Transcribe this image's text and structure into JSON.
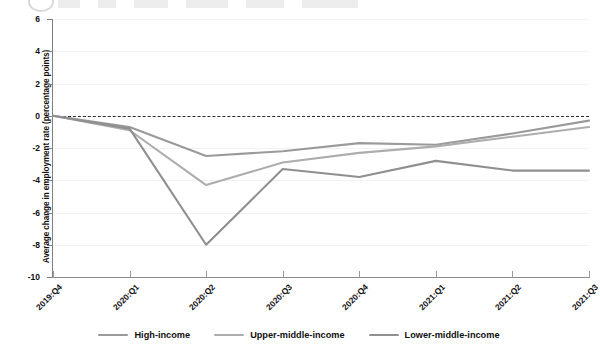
{
  "figure": {
    "logo_fragment": "circle-logo-icon"
  },
  "chart_data": {
    "type": "line",
    "title": "",
    "xlabel": "",
    "ylabel": "Average change in employment rate (percentage points)",
    "ylim": [
      -10,
      6
    ],
    "yticks": [
      6,
      4,
      2,
      0,
      -2,
      -4,
      -6,
      -8,
      -10
    ],
    "ytick_labels": [
      "6",
      "4",
      "2",
      "0",
      "-2",
      "-4",
      "-6",
      "-8",
      "-10"
    ],
    "grid": true,
    "legend_position": "bottom",
    "reference_line": {
      "value": 0,
      "style": "dashed",
      "color": "#2b2b2b"
    },
    "categories": [
      "2019:Q4",
      "2020:Q1",
      "2020:Q2",
      "2020:Q3",
      "2020:Q4",
      "2021:Q1",
      "2021:Q2",
      "2021:Q3"
    ],
    "series": [
      {
        "name": "High-income",
        "color": "#9a9a9a",
        "values": [
          0.0,
          -0.7,
          -2.5,
          -2.2,
          -1.7,
          -1.8,
          -1.1,
          -0.3
        ]
      },
      {
        "name": "Upper-middle-income",
        "color": "#adadad",
        "values": [
          0.0,
          -0.9,
          -4.3,
          -2.9,
          -2.3,
          -1.9,
          -1.3,
          -0.7
        ]
      },
      {
        "name": "Lower-middle-income",
        "color": "#8f8f8f",
        "values": [
          0.0,
          -0.8,
          -8.0,
          -3.3,
          -3.8,
          -2.8,
          -3.4,
          -3.4
        ]
      }
    ]
  },
  "legend": {
    "items": [
      {
        "label": "High-income",
        "color": "#9a9a9a"
      },
      {
        "label": "Upper-middle-income",
        "color": "#adadad"
      },
      {
        "label": "Lower-middle-income",
        "color": "#8f8f8f"
      }
    ]
  }
}
